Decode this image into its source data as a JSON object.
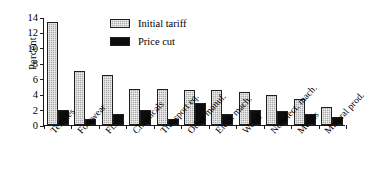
{
  "chart_data": {
    "type": "bar",
    "title": "",
    "xlabel": "",
    "ylabel": "Percent",
    "ylim": [
      0,
      14
    ],
    "yticks": [
      0,
      2,
      4,
      6,
      8,
      10,
      12,
      14
    ],
    "grid": false,
    "legend_position": "top-center",
    "categories": [
      "Textiles",
      "Footwear",
      "Fish",
      "Chemicals",
      "Transport eq.",
      "Other manuf.",
      "Elect. mach.",
      "Wood",
      "Nonelect. mach.",
      "Metals",
      "Mineral prod."
    ],
    "series": [
      {
        "name": "Initial tariff",
        "color": "#a8a8a8",
        "values": [
          13.4,
          7.0,
          6.5,
          4.7,
          4.7,
          4.6,
          4.6,
          4.3,
          3.9,
          3.4,
          2.3
        ]
      },
      {
        "name": "Price cut",
        "color": "#0d0d0d",
        "values": [
          1.9,
          0.8,
          1.4,
          1.9,
          0.8,
          2.8,
          1.4,
          1.9,
          1.8,
          1.4,
          1.1
        ]
      }
    ]
  }
}
